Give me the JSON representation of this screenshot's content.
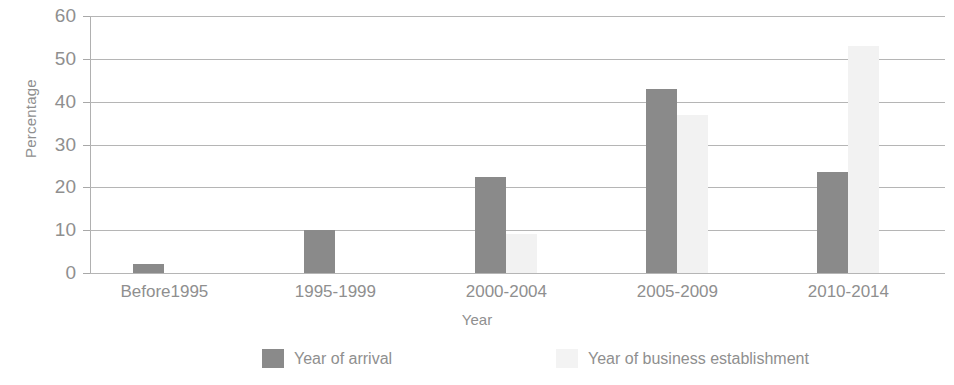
{
  "chart_data": {
    "type": "bar",
    "title": "",
    "xlabel": "Year",
    "ylabel": "Percentage",
    "categories": [
      "Before1995",
      "1995-1999",
      "2000-2004",
      "2005-2009",
      "2010-2014"
    ],
    "series": [
      {
        "name": "Year of arrival",
        "color": "#8a8a8a",
        "values": [
          2,
          10,
          22.5,
          43,
          23.5
        ]
      },
      {
        "name": "Year of business establishment",
        "color": "#f2f2f2",
        "values": [
          0,
          0,
          9,
          37,
          53
        ]
      }
    ],
    "ylim": [
      0,
      60
    ],
    "yticks": [
      0,
      10,
      20,
      30,
      40,
      50,
      60
    ],
    "ytick_labels": [
      "0",
      "10",
      "20",
      "30",
      "40",
      "50",
      "60"
    ],
    "grid": true,
    "legend_position": "bottom"
  },
  "axis": {
    "y_title": "Percentage",
    "x_title": "Year"
  },
  "legend": {
    "items": [
      {
        "label": "Year of arrival",
        "swatch": "legend-swatch-arrival"
      },
      {
        "label": "Year of business establishment",
        "swatch": "legend-swatch-business"
      }
    ]
  }
}
